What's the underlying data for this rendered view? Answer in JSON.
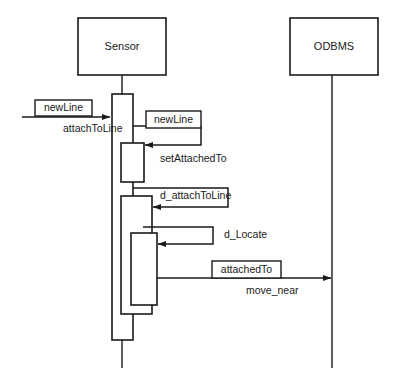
{
  "diagram": {
    "type": "uml-sequence-diagram",
    "title": "",
    "background_color": "#ffffff",
    "line_color": "#1a1a1a",
    "participants": [
      {
        "id": "sensor",
        "name": "Sensor",
        "box": {
          "x": 78,
          "y": 18,
          "w": 88,
          "h": 57
        },
        "lifeline_x": 122,
        "lifeline_top": 75,
        "lifeline_bottom": 368
      },
      {
        "id": "odbms",
        "name": "ODBMS",
        "box": {
          "x": 290,
          "y": 18,
          "w": 88,
          "h": 57
        },
        "lifeline_x": 332,
        "lifeline_top": 75,
        "lifeline_bottom": 368
      }
    ],
    "activations": [
      {
        "id": "act-sensor-outer",
        "participant": "sensor",
        "x": 112,
        "y": 94,
        "w": 21,
        "h": 246
      },
      {
        "id": "act-setattachedto",
        "participant": "sensor",
        "x": 121,
        "y": 143,
        "w": 23,
        "h": 39
      },
      {
        "id": "act-d-attachtoline",
        "participant": "sensor",
        "x": 121,
        "y": 196,
        "w": 31,
        "h": 118
      },
      {
        "id": "act-d-locate",
        "participant": "sensor",
        "x": 131,
        "y": 233,
        "w": 26,
        "h": 72
      }
    ],
    "messages": [
      {
        "id": "msg-attach-to-line",
        "kind": "found-call",
        "from": "external",
        "to": "sensor",
        "arrow": {
          "x1": 22,
          "y1": 117,
          "x2": 110,
          "y2": 117
        },
        "boxed_label": "newLine",
        "boxed_label_box": {
          "x": 35,
          "y": 100,
          "w": 57,
          "h": 16
        },
        "plain_label": "attachToLine",
        "plain_label_pos": {
          "x": 63,
          "y": 129
        }
      },
      {
        "id": "msg-set-attached-to",
        "kind": "self-call",
        "from": "sensor",
        "to": "sensor",
        "loop": {
          "x_start": 133,
          "y_start": 126,
          "x_out": 201,
          "y_end": 145,
          "x_arrow": 145
        },
        "boxed_label": "newLine",
        "boxed_label_box": {
          "x": 146,
          "y": 111,
          "w": 55,
          "h": 17
        },
        "plain_label": "setAttachedTo",
        "plain_label_pos": {
          "x": 160,
          "y": 159
        }
      },
      {
        "id": "msg-d-attach-to-line",
        "kind": "self-call",
        "from": "sensor",
        "to": "sensor",
        "loop": {
          "x_start": 133,
          "y_start": 188,
          "x_out": 228,
          "y_end": 207,
          "x_arrow": 153
        },
        "boxed_label": "",
        "plain_label": "d_attachToLine",
        "plain_label_pos": {
          "x": 160,
          "y": 196
        }
      },
      {
        "id": "msg-d-locate",
        "kind": "self-call",
        "from": "sensor",
        "to": "sensor",
        "loop": {
          "x_start": 143,
          "y_start": 227,
          "x_out": 213,
          "y_end": 244,
          "x_arrow": 158
        },
        "boxed_label": "",
        "plain_label": "d_Locate",
        "plain_label_pos": {
          "x": 224,
          "y": 235
        }
      },
      {
        "id": "msg-move-near",
        "kind": "call",
        "from": "sensor",
        "to": "odbms",
        "arrow": {
          "x1": 157,
          "y1": 278,
          "x2": 331,
          "y2": 278
        },
        "boxed_label": "attachedTo",
        "boxed_label_box": {
          "x": 212,
          "y": 261,
          "w": 69,
          "h": 17
        },
        "plain_label": "move_near",
        "plain_label_pos": {
          "x": 246,
          "y": 291
        }
      }
    ]
  }
}
